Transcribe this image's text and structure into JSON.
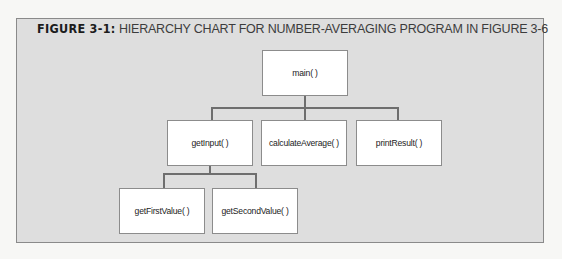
{
  "caption": {
    "figure_label": "FIGURE 3-1:",
    "title": "HIERARCHY CHART FOR NUMBER-AVERAGING PROGRAM IN FIGURE 3-6"
  },
  "nodes": {
    "main": "main( )",
    "getInput": "getInput( )",
    "calculateAverage": "calculateAverage( )",
    "printResult": "printResult( )",
    "getFirstValue": "getFirstValue( )",
    "getSecondValue": "getSecondValue( )"
  },
  "hierarchy": [
    {
      "parent": "main( )",
      "children": [
        "getInput( )",
        "calculateAverage( )",
        "printResult( )"
      ]
    },
    {
      "parent": "getInput( )",
      "children": [
        "getFirstValue( )",
        "getSecondValue( )"
      ]
    }
  ],
  "colors": {
    "frame_bg": "#dedede",
    "node_bg": "#ffffff",
    "connector": "#6e6e6e"
  }
}
